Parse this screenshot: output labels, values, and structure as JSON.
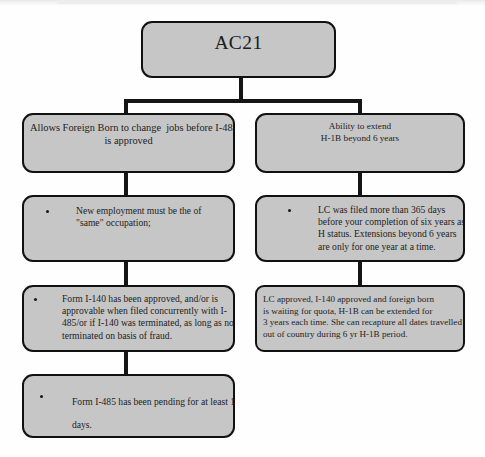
{
  "diagram": {
    "type": "flowchart",
    "title": "AC21",
    "root": {
      "id": "ac21",
      "label": "AC21"
    },
    "branches": [
      {
        "id": "left-branch",
        "heading": {
          "id": "left-heading",
          "lines": [
            "Allows Foreign Born to change  jobs before I-485",
            "is approved"
          ],
          "align": "center",
          "bullet": false
        },
        "steps": [
          {
            "id": "left-step-1",
            "bullet": true,
            "lines": [
              "New employment must be the of",
              "\"same\" occupation;"
            ]
          },
          {
            "id": "left-step-2",
            "bullet": true,
            "lines": [
              "Form I-140 has been approved, and/or is",
              "approvable when filed concurrently with I-",
              "485/or if I-140 was terminated, as long as not",
              "terminated on basis of fraud."
            ]
          },
          {
            "id": "left-step-3",
            "bullet": true,
            "lines": [
              "Form I-485 has been pending for at least 180",
              "days."
            ]
          }
        ]
      },
      {
        "id": "right-branch",
        "heading": {
          "id": "right-heading",
          "lines": [
            "Ability to extend",
            "H-1B beyond 6 years"
          ],
          "align": "center",
          "bullet": false
        },
        "steps": [
          {
            "id": "right-step-1",
            "bullet": true,
            "lines": [
              "LC was filed more than 365 days",
              "before your completion of six years as",
              "H status. Extensions beyond 6 years",
              "are only for one year at a time."
            ]
          },
          {
            "id": "right-step-2",
            "bullet": false,
            "lines": [
              "LC approved, I-140 approved and foreign born",
              "is waiting for quota, H-1B can be extended for",
              "3 years each time. She can recapture all dates travelled",
              "out of country during 6 yr H-1B period."
            ]
          }
        ]
      }
    ],
    "colors": {
      "node_fill": "#c6c6c6",
      "node_border": "#111111",
      "connector": "#151515",
      "page_background": "#fefefe",
      "text": "#1d1d1d"
    }
  }
}
